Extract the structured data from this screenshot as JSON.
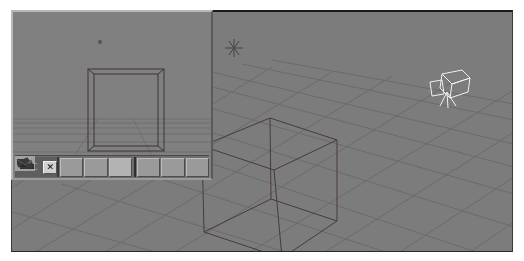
{
  "app": {
    "type": "3D modeling viewport"
  },
  "main_viewport": {
    "view": "perspective",
    "background_color": "#7c7c7c",
    "grid_color": "#6a6a6a",
    "objects": [
      {
        "type": "cube",
        "name": "cube-wireframe"
      },
      {
        "type": "light",
        "name": "point-light"
      },
      {
        "type": "camera",
        "name": "camera"
      }
    ]
  },
  "inset_viewport": {
    "view": "camera",
    "background_color": "#808080",
    "toolbar": {
      "lock_label": "C",
      "close_label": "✕",
      "buttons": [
        {
          "icon": "render-textured-icon"
        },
        {
          "icon": "render-shaded-icon"
        },
        {
          "icon": "camera-view-icon"
        },
        {
          "icon": "pan-icon"
        },
        {
          "icon": "orbit-icon"
        },
        {
          "icon": "dolly-icon"
        }
      ]
    }
  }
}
